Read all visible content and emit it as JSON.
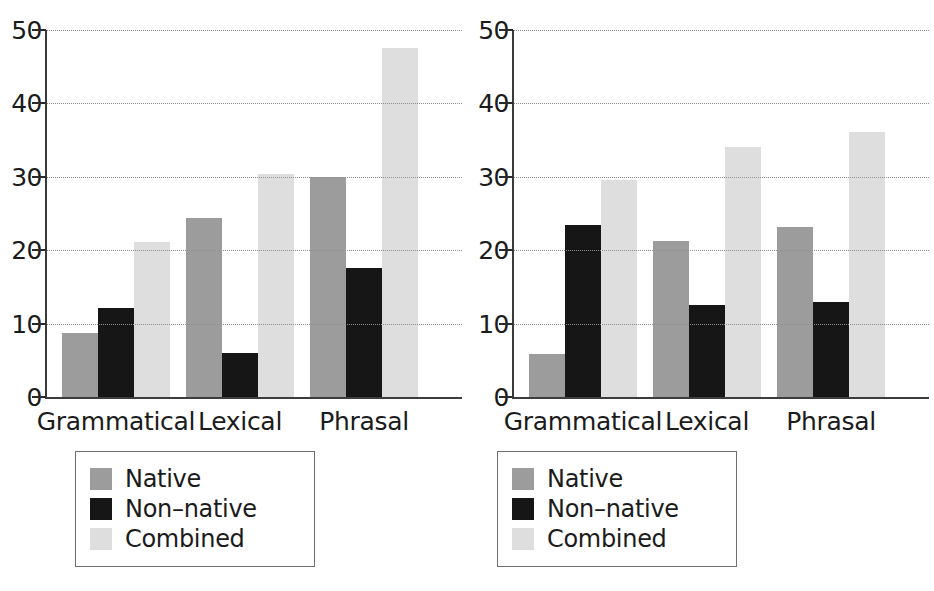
{
  "figure": {
    "panel_count": 2,
    "bar_colors": {
      "native": "#9c9c9c",
      "nonnative": "#161616",
      "combined": "#dedede"
    },
    "gridline_color": "#8e8e8e",
    "axis_color": "#3d3d3d"
  },
  "legend": {
    "entries": [
      {
        "label": "Native",
        "color": "#9c9c9c"
      },
      {
        "label": "Non–native",
        "color": "#161616"
      },
      {
        "label": "Combined",
        "color": "#dedede"
      }
    ]
  },
  "chart_data": [
    {
      "type": "bar",
      "title": "",
      "xlabel": "",
      "ylabel": "",
      "categories": [
        "Grammatical",
        "Lexical",
        "Phrasal"
      ],
      "series": [
        {
          "name": "Native",
          "values": [
            8.7,
            24.4,
            30.0
          ]
        },
        {
          "name": "Non–native",
          "values": [
            12.1,
            6.0,
            17.6
          ]
        },
        {
          "name": "Combined",
          "values": [
            21.1,
            30.4,
            47.5
          ]
        }
      ],
      "yticks": [
        0,
        10,
        20,
        30,
        40,
        50
      ],
      "ylim": [
        0,
        50
      ],
      "grid": true,
      "legend_position": "below"
    },
    {
      "type": "bar",
      "title": "",
      "xlabel": "",
      "ylabel": "",
      "categories": [
        "Grammatical",
        "Lexical",
        "Phrasal"
      ],
      "series": [
        {
          "name": "Native",
          "values": [
            5.8,
            21.3,
            23.1
          ]
        },
        {
          "name": "Non–native",
          "values": [
            23.5,
            12.5,
            12.9
          ]
        },
        {
          "name": "Combined",
          "values": [
            29.5,
            34.1,
            36.1
          ]
        }
      ],
      "yticks": [
        0,
        10,
        20,
        30,
        40,
        50
      ],
      "ylim": [
        0,
        50
      ],
      "grid": true,
      "legend_position": "below"
    }
  ]
}
